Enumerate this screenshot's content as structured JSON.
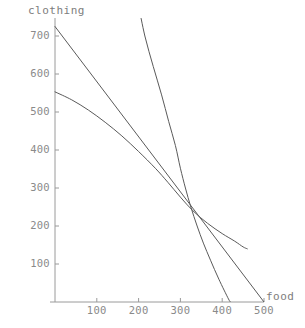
{
  "chart_data": {
    "type": "line",
    "title": "",
    "xlabel": "food",
    "ylabel": "clothing",
    "xlim": [
      0,
      530
    ],
    "ylim": [
      0,
      780
    ],
    "grid": false,
    "legend": null,
    "xticks": [
      100,
      200,
      300,
      400,
      500
    ],
    "yticks": [
      100,
      200,
      300,
      400,
      500,
      600,
      700
    ],
    "xtick_labels": [
      "100",
      "200",
      "300",
      "400",
      "500"
    ],
    "ytick_labels": [
      "100",
      "200",
      "300",
      "400",
      "500",
      "600",
      "700"
    ],
    "annotations": [],
    "series": [
      {
        "name": "budget-line",
        "type": "line",
        "points": [
          [
            0,
            725
          ],
          [
            500,
            0
          ]
        ]
      },
      {
        "name": "steep-indifference-curve",
        "type": "curve",
        "points": [
          [
            200,
            780
          ],
          [
            215,
            700
          ],
          [
            235,
            620
          ],
          [
            255,
            545
          ],
          [
            272,
            475
          ],
          [
            288,
            412
          ],
          [
            300,
            352
          ],
          [
            312,
            300
          ],
          [
            325,
            250
          ],
          [
            340,
            200
          ],
          [
            355,
            155
          ],
          [
            372,
            110
          ],
          [
            392,
            60
          ],
          [
            415,
            8
          ],
          [
            420,
            0
          ]
        ]
      },
      {
        "name": "flat-indifference-curve",
        "type": "curve",
        "points": [
          [
            0,
            553
          ],
          [
            40,
            532
          ],
          [
            80,
            505
          ],
          [
            120,
            473
          ],
          [
            160,
            437
          ],
          [
            200,
            396
          ],
          [
            240,
            352
          ],
          [
            270,
            315
          ],
          [
            300,
            276
          ],
          [
            330,
            240
          ],
          [
            365,
            207
          ],
          [
            400,
            180
          ],
          [
            430,
            160
          ],
          [
            450,
            145
          ],
          [
            460,
            140
          ]
        ]
      }
    ],
    "tangency_point": [
      300,
      250
    ],
    "axis_color": "#9a9a9a",
    "curve_color": "#5a5a5a",
    "text_color": "#8a8a8a",
    "background_color": "#ffffff"
  },
  "axes": {
    "ylabel": "clothing",
    "xlabel": "food"
  }
}
